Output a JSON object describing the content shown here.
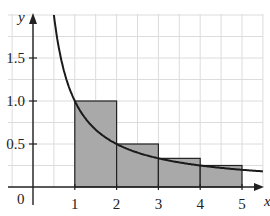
{
  "chart_data": {
    "type": "bar",
    "title": "",
    "xlabel": "x",
    "ylabel": "y",
    "x_ticks": [
      "1",
      "2",
      "3",
      "4",
      "5"
    ],
    "y_ticks": [
      "0.5",
      "1.0",
      "1.5"
    ],
    "origin_label": "0",
    "xlim": [
      -0.8,
      5.5
    ],
    "ylim": [
      0,
      2.0
    ],
    "grid": true,
    "curve": {
      "function": "y = 1/x",
      "x_range": [
        0.5,
        5.5
      ]
    },
    "categories": [
      "[1,2]",
      "[2,3]",
      "[3,4]",
      "[4,5]"
    ],
    "values": [
      1.0,
      0.5,
      0.333,
      0.25
    ],
    "bar_edges": [
      1,
      2,
      3,
      4,
      5
    ],
    "colors": {
      "bar_fill": "#a9a9a9",
      "curve": "#1a1a1a",
      "grid": "#d9d9d9",
      "axis": "#222222"
    }
  }
}
